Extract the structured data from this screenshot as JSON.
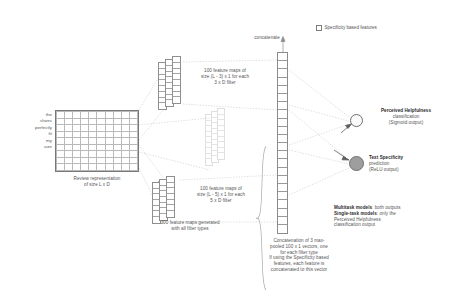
{
  "figure": {
    "legend": {
      "icon": "square-outline-icon",
      "label": "Specificity based features"
    },
    "concatenate_label": "concatenate",
    "input": {
      "words": [
        "the",
        "shoes",
        "perfectly",
        "fit",
        "my",
        "size"
      ],
      "caption_line1": "Review representation",
      "caption_line2": "of size L x D"
    },
    "featuremaps_top": {
      "line1": "100 feature maps of",
      "line2": "size (L - 3) x 1 for each",
      "line3": "3 x D filter"
    },
    "featuremaps_bottom": {
      "line1": "100 feature maps of",
      "line2": "size (L - 5) x 1 for each",
      "line3": "5 x D filter"
    },
    "featuremaps_total": {
      "line1": "300 feature maps generated",
      "line2": "with all filter types"
    },
    "concatenation_caption": {
      "line1": "Concatenation of 3 max-",
      "line2": "pooled 100 x 1 vectors, one",
      "line3": "for each filter type",
      "line4": "If using the Specificity based",
      "line5": "features, each feature is",
      "line6": "concatenated to this vector"
    },
    "outputs": [
      {
        "name": "perceived-helpfulness",
        "line1": "Perceived Helpfulness",
        "line2": "classification",
        "line3": "(Sigmoid output)",
        "node_fill": "#fafafa"
      },
      {
        "name": "text-specificity",
        "line1": "Text Specificity",
        "line2": "prediction",
        "line3": "(ReLU output)",
        "node_fill": "#9e9e9e"
      }
    ],
    "model_note": {
      "bold1": "Multitask models",
      "rest1": ": both outputs",
      "bold2": "Single-task models",
      "rest2": ": only the",
      "line3": "Perceived Helpfulness",
      "line4": "classification output"
    }
  }
}
